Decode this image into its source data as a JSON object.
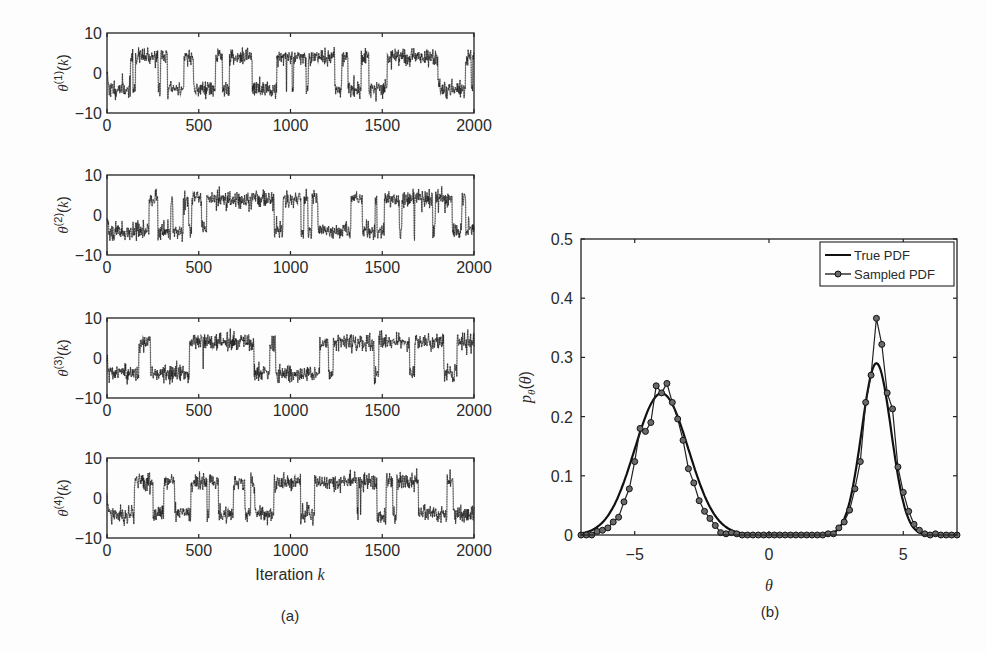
{
  "figure": {
    "caption_a": "(a)",
    "caption_b": "(b)"
  },
  "chart_data": [
    {
      "type": "line",
      "panel": "a",
      "title": "",
      "description": "MCMC trace plots of four chains, theta^(i)(k) vs iteration k; samples jump between modes near -4 and +4",
      "xlabel": "Iteration k",
      "xlim": [
        0,
        2000
      ],
      "xticks": [
        0,
        500,
        1000,
        1500,
        2000
      ],
      "ylim": [
        -10,
        10
      ],
      "yticks": [
        -10,
        0,
        10
      ],
      "subplots": [
        {
          "ylabel": "θ(1)(k)",
          "ylabel_base": "θ",
          "ylabel_sup": "(1)",
          "ylabel_arg": "(k)",
          "seed": 11,
          "modes": [
            -4,
            4
          ]
        },
        {
          "ylabel": "θ(2)(k)",
          "ylabel_base": "θ",
          "ylabel_sup": "(2)",
          "ylabel_arg": "(k)",
          "seed": 23,
          "modes": [
            -4,
            4
          ]
        },
        {
          "ylabel": "θ(3)(k)",
          "ylabel_base": "θ",
          "ylabel_sup": "(3)",
          "ylabel_arg": "(k)",
          "seed": 37,
          "modes": [
            -4,
            4
          ]
        },
        {
          "ylabel": "θ(4)(k)",
          "ylabel_base": "θ",
          "ylabel_sup": "(4)",
          "ylabel_arg": "(k)",
          "seed": 53,
          "modes": [
            -4,
            4
          ]
        }
      ],
      "marker": "+",
      "grid": false
    },
    {
      "type": "line",
      "panel": "b",
      "title": "",
      "xlabel": "θ",
      "ylabel": "pθ(θ)",
      "xlim": [
        -7,
        7
      ],
      "ylim": [
        0,
        0.5
      ],
      "xticks": [
        -5,
        0,
        5
      ],
      "xtick_labels": [
        "−5",
        "0",
        "5"
      ],
      "yticks": [
        0,
        0.1,
        0.2,
        0.3,
        0.4,
        0.5
      ],
      "ytick_labels": [
        "0",
        "0.1",
        "0.2",
        "0.3",
        "0.4",
        "0.5"
      ],
      "legend": {
        "position": "upper right",
        "entries": [
          "True PDF",
          "Sampled PDF"
        ]
      },
      "grid": false,
      "series": [
        {
          "name": "True PDF",
          "model": "mixture of two Gaussians",
          "components": [
            {
              "mean": -4,
              "std": 1.0,
              "weight": 0.6
            },
            {
              "mean": 4,
              "std": 0.55,
              "weight": 0.4
            }
          ],
          "peaks": [
            {
              "x": -4,
              "y": 0.24
            },
            {
              "x": 4,
              "y": 0.36
            }
          ]
        },
        {
          "name": "Sampled PDF",
          "marker": "o",
          "x": [
            -7.0,
            -6.8,
            -6.6,
            -6.4,
            -6.2,
            -6.0,
            -5.8,
            -5.6,
            -5.4,
            -5.2,
            -5.0,
            -4.8,
            -4.6,
            -4.4,
            -4.2,
            -4.0,
            -3.8,
            -3.6,
            -3.4,
            -3.2,
            -3.0,
            -2.8,
            -2.6,
            -2.4,
            -2.2,
            -2.0,
            -1.8,
            -1.6,
            -1.4,
            -1.2,
            -1.0,
            -0.8,
            -0.6,
            -0.4,
            -0.2,
            0.0,
            0.2,
            0.4,
            0.6,
            0.8,
            1.0,
            1.2,
            1.4,
            1.6,
            1.8,
            2.0,
            2.2,
            2.4,
            2.6,
            2.8,
            3.0,
            3.2,
            3.4,
            3.6,
            3.8,
            4.0,
            4.2,
            4.4,
            4.6,
            4.8,
            5.0,
            5.2,
            5.4,
            5.6,
            5.8,
            6.0,
            6.2,
            6.4,
            6.6,
            6.8,
            7.0
          ],
          "y": [
            0.0,
            0.0,
            0.0,
            0.006,
            0.008,
            0.012,
            0.022,
            0.03,
            0.056,
            0.078,
            0.124,
            0.18,
            0.175,
            0.19,
            0.252,
            0.24,
            0.256,
            0.224,
            0.196,
            0.16,
            0.112,
            0.088,
            0.058,
            0.04,
            0.028,
            0.016,
            0.004,
            0.002,
            0.004,
            0.002,
            0.0,
            0.0,
            0.0,
            0.0,
            0.0,
            0.0,
            0.0,
            0.0,
            0.0,
            0.0,
            0.0,
            0.0,
            0.0,
            0.0,
            0.0,
            0.0,
            0.002,
            0.002,
            0.012,
            0.022,
            0.042,
            0.078,
            0.124,
            0.224,
            0.27,
            0.366,
            0.322,
            0.24,
            0.213,
            0.115,
            0.072,
            0.04,
            0.018,
            0.008,
            0.002,
            0.0,
            0.002,
            0.0,
            0.0,
            0.0,
            0.0
          ]
        }
      ]
    }
  ]
}
